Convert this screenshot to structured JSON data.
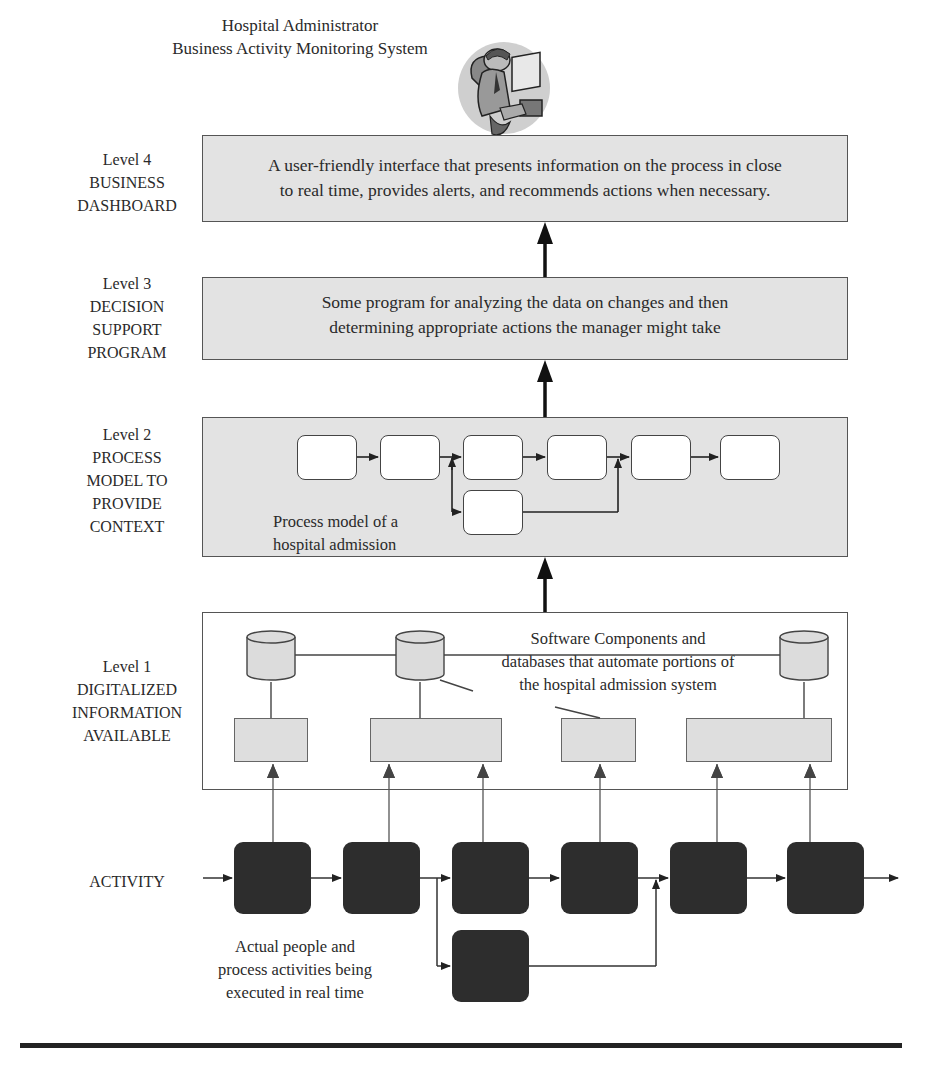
{
  "header": {
    "title_line1": "Hospital Administrator",
    "title_line2": "Business Activity Monitoring System",
    "illustration": "person-at-computer-icon"
  },
  "levels": [
    {
      "id": "level4",
      "label_lines": [
        "Level 4",
        "BUSINESS",
        "DASHBOARD"
      ],
      "text_lines": [
        "A user-friendly interface that presents information on the process in close",
        "to real time, provides alerts, and recommends actions when necessary."
      ]
    },
    {
      "id": "level3",
      "label_lines": [
        "Level 3",
        "DECISION",
        "SUPPORT",
        "PROGRAM"
      ],
      "text_lines": [
        "Some program for analyzing the data on changes and then",
        "determining appropriate actions the manager might take"
      ]
    },
    {
      "id": "level2",
      "label_lines": [
        "Level 2",
        "PROCESS",
        "MODEL TO",
        "PROVIDE",
        "CONTEXT"
      ],
      "text_lines": [
        "Process model of a",
        "hospital admission"
      ]
    },
    {
      "id": "level1",
      "label_lines": [
        "Level 1",
        "DIGITALIZED",
        "INFORMATION",
        "AVAILABLE"
      ],
      "text_lines": [
        "Software Components and",
        "databases that automate portions of",
        "the hospital admission system"
      ]
    }
  ],
  "activity": {
    "label": "ACTIVITY",
    "caption_lines": [
      "Actual people and",
      "process activities being",
      "executed in real time"
    ]
  },
  "colors": {
    "panel_fill": "#e3e3e3",
    "activity_fill": "#2d2d2d",
    "line": "#222222"
  }
}
